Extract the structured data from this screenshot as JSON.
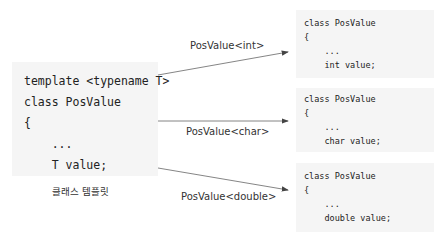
{
  "template_box": {
    "lines": [
      "template <typename T>",
      "class PosValue",
      "{",
      "    ...",
      "    T value;"
    ],
    "caption": "클래스 템플릿"
  },
  "arrows": [
    {
      "label": "PosValue<int>"
    },
    {
      "label": "PosValue<char>"
    },
    {
      "label": "PosValue<double>"
    }
  ],
  "instances": [
    {
      "lines": [
        "class PosValue",
        "{",
        "    ...",
        "    int value;"
      ]
    },
    {
      "lines": [
        "class PosValue",
        "{",
        "    ...",
        "    char value;"
      ]
    },
    {
      "lines": [
        "class PosValue",
        "{",
        "    ...",
        "    double value;"
      ]
    }
  ],
  "colors": {
    "box_bg": "#f5f5f5",
    "arrow": "#555555",
    "text": "#222222"
  }
}
